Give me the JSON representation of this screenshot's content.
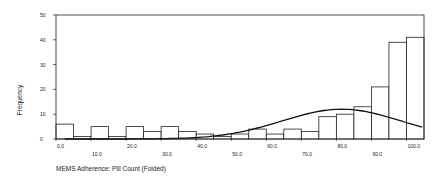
{
  "chart_data": {
    "type": "bar",
    "title": "",
    "xlabel": "MEMS Adherence: Pill Count (Folded)",
    "ylabel": "Frequency",
    "ylim": [
      0,
      50
    ],
    "yticks": [
      0,
      10,
      20,
      30,
      40,
      50
    ],
    "xtick_labels": [
      "0.0",
      "10.0",
      "20.0",
      "30.0",
      "40.0",
      "50.0",
      "60.0",
      "70.0",
      "80.0",
      "90.0",
      "100.0"
    ],
    "x": [
      0,
      5,
      10,
      15,
      20,
      25,
      30,
      35,
      40,
      45,
      50,
      55,
      60,
      65,
      70,
      75,
      80,
      85,
      90,
      95,
      100
    ],
    "values": [
      6,
      1,
      5,
      1,
      5,
      3,
      5,
      3,
      2,
      1,
      2,
      4,
      2,
      4,
      3,
      9,
      10,
      13,
      21,
      39,
      41
    ],
    "overlay": {
      "type": "normal-curve",
      "peak_x": 80,
      "peak_y": 12
    },
    "grid": false,
    "legend": null
  }
}
